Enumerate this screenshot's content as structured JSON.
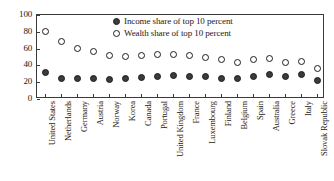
{
  "chart_data": {
    "type": "scatter",
    "title": "",
    "subtitle": "",
    "xlabel": "",
    "ylabel": "",
    "ylim": [
      0,
      100
    ],
    "yticks": [
      0,
      20,
      40,
      60,
      80,
      100
    ],
    "grid": false,
    "legend_position": "top-center",
    "categories": [
      "United States",
      "Netherlands",
      "Germany",
      "Austria",
      "Norway",
      "Korea",
      "Canada",
      "Portugal",
      "United Kingdom",
      "France",
      "Luxembourg",
      "Finland",
      "Belgium",
      "Spain",
      "Australia",
      "Greece",
      "Italy",
      "Slovak Republic"
    ],
    "series": [
      {
        "name": "Income share of top 10 percent",
        "marker": "filled-circle",
        "color": "#3b3b3b",
        "values": [
          31,
          24,
          25,
          24,
          23,
          25,
          26,
          27,
          28,
          27,
          27,
          24,
          24,
          27,
          29,
          27,
          29,
          22
        ]
      },
      {
        "name": "Wealth share of top 10 percent",
        "marker": "hollow-circle",
        "color": "#ffffff",
        "values": [
          80,
          68,
          60,
          56,
          52,
          51,
          52,
          53,
          53,
          52,
          50,
          47,
          44,
          47,
          48,
          44,
          45,
          36
        ]
      }
    ]
  },
  "legend": {
    "items": [
      {
        "label": "Income share of top 10 percent",
        "marker": "filled-circle"
      },
      {
        "label": "Wealth share of top 10 percent",
        "marker": "hollow-circle"
      }
    ]
  }
}
